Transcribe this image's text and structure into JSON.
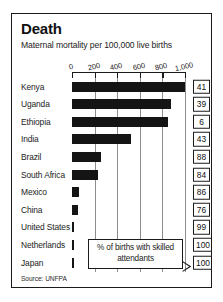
{
  "figure": {
    "title": "Death",
    "subtitle": "Maternal mortality per 100,000 live births",
    "source": "Source: UNFPA",
    "legend_note": "% of births with skilled attendants",
    "border_color": "#1b1b1b",
    "bar_color": "#141414",
    "gridline_color": "#8d8d8d",
    "background": "#ffffff"
  },
  "chart_data": {
    "type": "bar",
    "orientation": "horizontal",
    "title": "Death",
    "subtitle": "Maternal mortality per 100,000 live births",
    "xlabel": "",
    "ylabel": "",
    "xlim": [
      0,
      1000
    ],
    "grid": true,
    "legend_position": "inside-bottom-right",
    "source": "Source: UNFPA",
    "tick_labels": [
      "0",
      "200",
      "400",
      "600",
      "800",
      "1,000"
    ],
    "ticks": [
      0,
      200,
      400,
      600,
      800,
      1000
    ],
    "categories": [
      "Kenya",
      "Uganda",
      "Ethiopia",
      "India",
      "Brazil",
      "South Africa",
      "Mexico",
      "China",
      "United States",
      "Netherlands",
      "Japan"
    ],
    "series": [
      {
        "name": "Maternal mortality per 100,000 live births",
        "values": [
          1000,
          880,
          850,
          520,
          260,
          230,
          65,
          55,
          20,
          12,
          10
        ]
      },
      {
        "name": "% of births with skilled attendants",
        "values": [
          41,
          39,
          6,
          43,
          88,
          84,
          86,
          76,
          99,
          100,
          100
        ]
      }
    ],
    "rows": [
      {
        "category": "Kenya",
        "bar_value": 1000,
        "attendant_pct": "41"
      },
      {
        "category": "Uganda",
        "bar_value": 880,
        "attendant_pct": "39"
      },
      {
        "category": "Ethiopia",
        "bar_value": 850,
        "attendant_pct": "6"
      },
      {
        "category": "India",
        "bar_value": 520,
        "attendant_pct": "43"
      },
      {
        "category": "Brazil",
        "bar_value": 260,
        "attendant_pct": "88"
      },
      {
        "category": "South Africa",
        "bar_value": 230,
        "attendant_pct": "84"
      },
      {
        "category": "Mexico",
        "bar_value": 65,
        "attendant_pct": "86"
      },
      {
        "category": "China",
        "bar_value": 55,
        "attendant_pct": "76"
      },
      {
        "category": "United States",
        "bar_value": 20,
        "attendant_pct": "99"
      },
      {
        "category": "Netherlands",
        "bar_value": 12,
        "attendant_pct": "100"
      },
      {
        "category": "Japan",
        "bar_value": 10,
        "attendant_pct": "100"
      }
    ]
  }
}
